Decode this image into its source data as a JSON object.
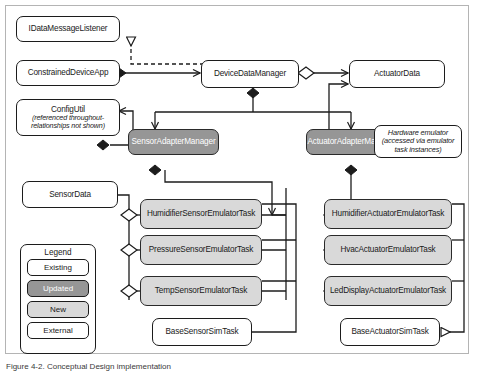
{
  "figure": {
    "caption": "Figure 4-2. Conceptual Design implementation",
    "background": "#ffffff",
    "border_color": "#b4b4b4"
  },
  "colors": {
    "existing_fill": "#ffffff",
    "updated_fill": "#969696",
    "new_fill": "#d9d9d9",
    "external_fill": "#ffffff",
    "stroke": "#1c1c1c"
  },
  "nodes": {
    "idatamessagelistener": {
      "label": "IDataMessageListener",
      "style": "existing"
    },
    "constraineddeviceapp": {
      "label": "ConstrainedDeviceApp",
      "style": "existing"
    },
    "configutil": {
      "label": "ConfigUtil",
      "sub": "(referenced throughout-relationships not shown)",
      "style": "existing"
    },
    "devicedatamanager": {
      "label": "DeviceDataManager",
      "style": "existing"
    },
    "actuatordata": {
      "label": "ActuatorData",
      "style": "existing"
    },
    "sensoradaptermanager": {
      "label": "SensorAdapterManager",
      "style": "updated"
    },
    "actuatoradaptermanager": {
      "label": "ActuatorAdapterManager",
      "style": "updated"
    },
    "hardware_emulator_note": {
      "label": "Hardware emulator (accessed via emulator task instances)",
      "style": "existing"
    },
    "sensordata": {
      "label": "SensorData",
      "style": "existing"
    },
    "humidifiersensoremulatortask": {
      "label": "HumidifierSensorEmulatorTask",
      "style": "new"
    },
    "pressuresensoremulatortask": {
      "label": "PressureSensorEmulatorTask",
      "style": "new"
    },
    "tempsensoremulatortask": {
      "label": "TempSensorEmulatorTask",
      "style": "new"
    },
    "humidifieractuatoremulatortask": {
      "label": "HumidifierActuatorEmulatorTask",
      "style": "new"
    },
    "hvacactuatoremulatortask": {
      "label": "HvacActuatorEmulatorTask",
      "style": "new"
    },
    "leddisplayactuatoremulatortask": {
      "label": "LedDisplayActuatorEmulatorTask",
      "style": "new"
    },
    "basesensorsimtask": {
      "label": "BaseSensorSimTask",
      "style": "existing"
    },
    "baseactuatorsimtask": {
      "label": "BaseActuatorSimTask",
      "style": "existing"
    }
  },
  "legend": {
    "title": "Legend",
    "items": [
      {
        "label": "Existing",
        "style": "existing"
      },
      {
        "label": "Updated",
        "style": "updated"
      },
      {
        "label": "New",
        "style": "new"
      },
      {
        "label": "External",
        "style": "external"
      }
    ]
  }
}
